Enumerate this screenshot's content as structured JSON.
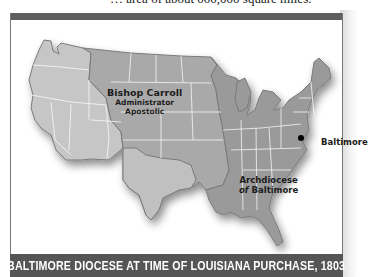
{
  "top_text": "… area of about 000,000 square miles.",
  "map": {
    "title": "BALTIMORE DIOCESE AT TIME OF LOUISIANA PURCHASE, 1803",
    "labels": {
      "carroll": "Bishop Carroll",
      "carroll_line2": "Administrator",
      "carroll_line3": "Apostolic",
      "archdiocese_line1": "Archdiocese",
      "archdiocese_of": "of",
      "archdiocese_line2": " Baltimore",
      "baltimore_city": "Baltimore"
    },
    "colors": {
      "west_region": "#c6c6c6",
      "carroll_region": "#a9a9a9",
      "archdiocese_region": "#9a9a9a",
      "caption_bar": "#555555",
      "state_lines": "#ffffff",
      "outline": "#7a7a7a"
    },
    "regions": [
      {
        "name": "Western territories (outside diocese)"
      },
      {
        "name": "Bishop Carroll Administrator Apostolic (Louisiana Purchase)"
      },
      {
        "name": "Archdiocese of Baltimore"
      }
    ],
    "points": [
      {
        "name": "Baltimore",
        "marker": "black-dot"
      }
    ]
  }
}
